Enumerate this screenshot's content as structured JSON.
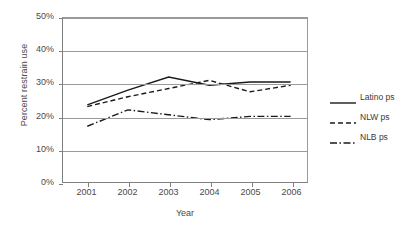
{
  "chart_data": {
    "type": "line",
    "title": "",
    "xlabel": "Year",
    "ylabel": "Percent restrain use",
    "categories": [
      "2001",
      "2002",
      "2003",
      "2004",
      "2005",
      "2006"
    ],
    "x": [
      2001,
      2002,
      2003,
      2004,
      2005,
      2006
    ],
    "ylim": [
      0,
      50
    ],
    "ytick_labels": [
      "0%",
      "10%",
      "20%",
      "30%",
      "40%",
      "50%"
    ],
    "ytick_values": [
      0,
      10,
      20,
      30,
      40,
      50
    ],
    "yunit": "%",
    "grid": "horizontal",
    "legend_position": "right",
    "series": [
      {
        "name": "Latino ps",
        "style": "solid",
        "color": "#1a1a1a",
        "values": [
          23.5,
          28.0,
          32.0,
          29.5,
          30.5,
          30.5
        ]
      },
      {
        "name": "NLW ps",
        "style": "dashed",
        "color": "#1a1a1a",
        "values": [
          23.0,
          26.0,
          28.5,
          31.0,
          27.5,
          29.5
        ]
      },
      {
        "name": "NLB ps",
        "style": "dashdot",
        "color": "#1a1a1a",
        "values": [
          17.0,
          22.0,
          20.5,
          19.0,
          20.0,
          20.0
        ]
      }
    ]
  },
  "legend": {
    "items": [
      {
        "label": "Latino ps",
        "style": "solid"
      },
      {
        "label": "NLW ps",
        "style": "dashed"
      },
      {
        "label": "NLB ps",
        "style": "dashdot"
      }
    ]
  },
  "axes": {
    "y_title": "Percent restrain use",
    "x_title": "Year"
  }
}
